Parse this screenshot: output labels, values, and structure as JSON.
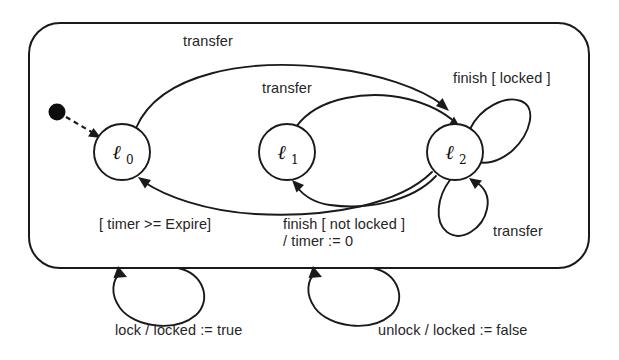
{
  "diagram": {
    "type": "uml-state-machine",
    "title": "",
    "colors": {
      "stroke": "#1a1a1a",
      "text": "#262626",
      "background": "#ffffff",
      "initial_dot": "#0d0d0d"
    },
    "region": {
      "name": "composite-state-region",
      "shape": "rounded-rectangle"
    },
    "initial_marker": {
      "name": "initial-pseudostate",
      "target": "l0",
      "arrow_style": "dashed"
    },
    "states": [
      {
        "id": "l0",
        "base": "ℓ",
        "subscript": "0"
      },
      {
        "id": "l1",
        "base": "ℓ",
        "subscript": "1"
      },
      {
        "id": "l2",
        "base": "ℓ",
        "subscript": "2"
      }
    ],
    "transitions": [
      {
        "id": "t-l0-l2",
        "from": "l0",
        "to": "l2",
        "label": "transfer",
        "shape": "outer-top-arc"
      },
      {
        "id": "t-l1-l2",
        "from": "l1",
        "to": "l2",
        "label": "transfer",
        "shape": "inner-top-arc"
      },
      {
        "id": "t-l2-l0",
        "from": "l2",
        "to": "l0",
        "label": "[ timer >= Expire]",
        "shape": "outer-bottom-arc"
      },
      {
        "id": "t-l2-l1",
        "from": "l2",
        "to": "l1",
        "label_line1": "finish [ not locked ]",
        "label_line2": "/ timer := 0",
        "shape": "inner-bottom-arc"
      },
      {
        "id": "t-l2-self-finish",
        "from": "l2",
        "to": "l2",
        "label": "finish [ locked ]",
        "shape": "self-loop-upper-right"
      },
      {
        "id": "t-l2-self-transfer",
        "from": "l2",
        "to": "l2",
        "label": "transfer",
        "shape": "self-loop-lower-right"
      },
      {
        "id": "t-region-self-lock",
        "from": "region",
        "to": "region",
        "label": "lock / locked := true",
        "shape": "self-loop-below-left"
      },
      {
        "id": "t-region-self-unlock",
        "from": "region",
        "to": "region",
        "label": "unlock / locked := false",
        "shape": "self-loop-below-right"
      }
    ]
  }
}
